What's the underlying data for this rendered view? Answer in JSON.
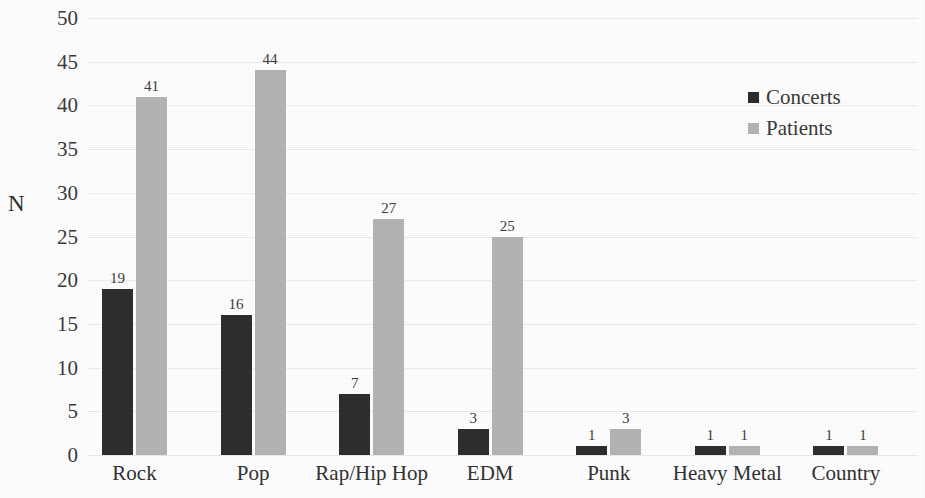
{
  "chart_data": {
    "type": "bar",
    "title": "",
    "subtitle": "",
    "xlabel": "",
    "ylabel": "N",
    "ylim": [
      0,
      50
    ],
    "ytick_step": 5,
    "yticks": [
      "50",
      "45",
      "40",
      "35",
      "30",
      "25",
      "20",
      "15",
      "10",
      "5",
      "0"
    ],
    "grid": true,
    "grid_axis": "y",
    "legend_position": "top-right",
    "categories": [
      "Rock",
      "Pop",
      "Rap/Hip Hop",
      "EDM",
      "Punk",
      "Heavy Metal",
      "Country"
    ],
    "series": [
      {
        "name": "Concerts",
        "color": "#2e2e2e",
        "values": [
          19,
          16,
          7,
          3,
          1,
          1,
          1
        ],
        "labels": [
          "19",
          "16",
          "7",
          "3",
          "1",
          "1",
          "1"
        ]
      },
      {
        "name": "Patients",
        "color": "#b5b5b5",
        "values": [
          41,
          44,
          27,
          25,
          3,
          1,
          1
        ],
        "labels": [
          "41",
          "44",
          "27",
          "25",
          "3",
          "1",
          "1"
        ]
      }
    ]
  },
  "legend": {
    "items": [
      {
        "label": "Concerts",
        "color": "#2e2e2e"
      },
      {
        "label": "Patients",
        "color": "#b5b5b5"
      }
    ]
  },
  "colors": {
    "concerts": "#2e2e2e",
    "patients": "#b5b5b5",
    "gridline": "#ededed",
    "axis": "#bdbdbd",
    "text": "#3a3a3a",
    "background": "#ffffff"
  }
}
